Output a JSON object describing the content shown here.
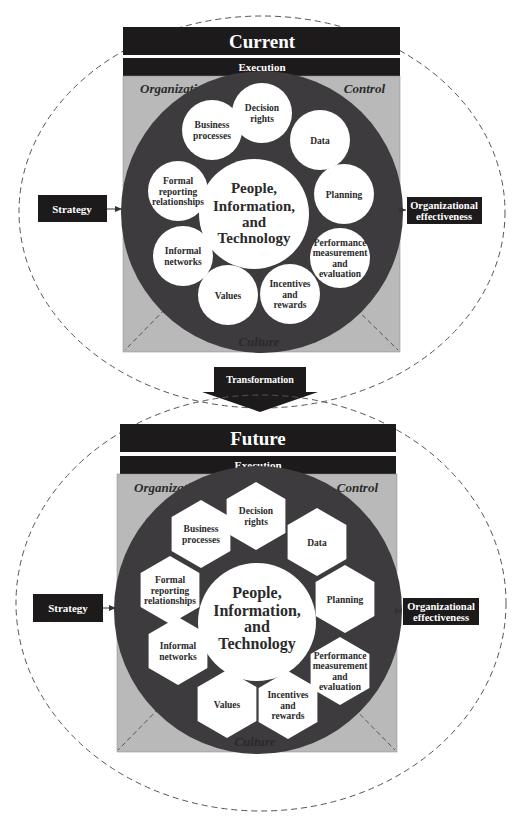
{
  "colors": {
    "bar": "#1c1a1b",
    "panel": "#b9b9b9",
    "ring": "#3d3b3d",
    "node": "#ffffff",
    "text_dark": "#2a2a2a",
    "text_light": "#ffffff",
    "dash": "#555555"
  },
  "current": {
    "title": "Current",
    "execution_label": "Execution",
    "organization_label": "Organization",
    "control_label": "Control",
    "culture_label": "Culture",
    "strategy_label": "Strategy",
    "outcome_label_line1": "Organizational",
    "outcome_label_line2": "effectiveness",
    "center": {
      "line1": "People,",
      "line2": "Information,",
      "line3": "and",
      "line4": "Technology"
    },
    "node_shape": "circle",
    "nodes": [
      {
        "id": "decision-rights",
        "lines": [
          "Decision",
          "rights"
        ]
      },
      {
        "id": "data",
        "lines": [
          "Data"
        ]
      },
      {
        "id": "planning",
        "lines": [
          "Planning"
        ]
      },
      {
        "id": "performance",
        "lines": [
          "Performance",
          "measurement",
          "and",
          "evaluation"
        ]
      },
      {
        "id": "incentives",
        "lines": [
          "Incentives",
          "and",
          "rewards"
        ]
      },
      {
        "id": "values",
        "lines": [
          "Values"
        ]
      },
      {
        "id": "informal-networks",
        "lines": [
          "Informal",
          "networks"
        ]
      },
      {
        "id": "formal-reporting",
        "lines": [
          "Formal",
          "reporting",
          "relationships"
        ]
      },
      {
        "id": "business-processes",
        "lines": [
          "Business",
          "processes"
        ]
      }
    ]
  },
  "transition": {
    "label": "Transformation"
  },
  "future": {
    "title": "Future",
    "execution_label": "Execution",
    "organization_label": "Organization",
    "control_label": "Control",
    "culture_label": "Culture",
    "strategy_label": "Strategy",
    "outcome_label_line1": "Organizational",
    "outcome_label_line2": "effectiveness",
    "center": {
      "line1": "People,",
      "line2": "Information,",
      "line3": "and",
      "line4": "Technology"
    },
    "node_shape": "hexagon",
    "nodes": [
      {
        "id": "decision-rights",
        "lines": [
          "Decision",
          "rights"
        ]
      },
      {
        "id": "data",
        "lines": [
          "Data"
        ]
      },
      {
        "id": "planning",
        "lines": [
          "Planning"
        ]
      },
      {
        "id": "performance",
        "lines": [
          "Performance",
          "measurement",
          "and",
          "evaluation"
        ]
      },
      {
        "id": "incentives",
        "lines": [
          "Incentives",
          "and",
          "rewards"
        ]
      },
      {
        "id": "values",
        "lines": [
          "Values"
        ]
      },
      {
        "id": "informal-networks",
        "lines": [
          "Informal",
          "networks"
        ]
      },
      {
        "id": "formal-reporting",
        "lines": [
          "Formal",
          "reporting",
          "relationships"
        ]
      },
      {
        "id": "business-processes",
        "lines": [
          "Business",
          "processes"
        ]
      }
    ]
  }
}
